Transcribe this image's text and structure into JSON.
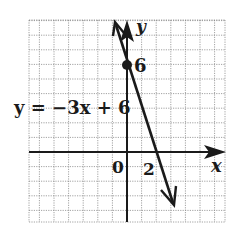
{
  "chart_data": {
    "type": "line",
    "title": "",
    "equation_label": "y = −3x + 6",
    "xlabel": "x",
    "ylabel": "y",
    "tick_labels": {
      "origin": "0",
      "x_intercept": "2",
      "y_intercept": "6"
    },
    "series": [
      {
        "name": "y = -3x + 6",
        "slope": -3,
        "intercept": 6,
        "x": [
          -0.8,
          0,
          2,
          3.2
        ],
        "values": [
          8.4,
          6,
          0,
          -3.6
        ]
      }
    ],
    "points": [
      {
        "x": 0,
        "y": 6,
        "label": "6",
        "marker": "filled-circle"
      }
    ],
    "xlim": [
      -6.7,
      6.6
    ],
    "ylim": [
      -4.8,
      9
    ],
    "grid": true,
    "grid_step": 1
  },
  "labels": {
    "equation": "y = −3x + 6",
    "x_axis": "x",
    "y_axis": "y",
    "origin": "0",
    "x_tick": "2",
    "y_tick": "6"
  },
  "colors": {
    "ink": "#1a1a1a",
    "grid": "#8a8a8a",
    "background": "#ffffff"
  }
}
